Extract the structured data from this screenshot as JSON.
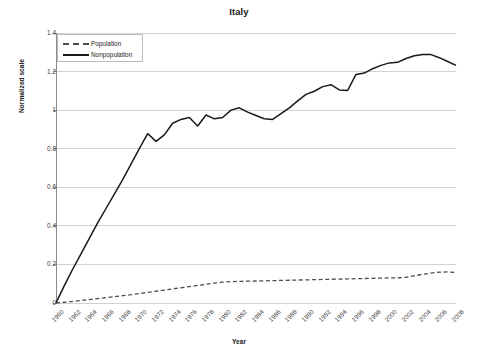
{
  "chart_data": {
    "type": "line",
    "title": "Italy",
    "xlabel": "Year",
    "ylabel": "Normalized scale",
    "xlim": [
      1960,
      2008
    ],
    "ylim": [
      0,
      1.4
    ],
    "yticks": [
      "0",
      "0.2",
      "0.4",
      "0.6",
      "0.8",
      "1",
      "1.2",
      "1.4"
    ],
    "ytick_values": [
      0,
      0.2,
      0.4,
      0.6,
      0.8,
      1.0,
      1.2,
      1.4
    ],
    "xticks": [
      "1960",
      "1962",
      "1964",
      "1966",
      "1968",
      "1970",
      "1972",
      "1974",
      "1976",
      "1978",
      "1980",
      "1982",
      "1984",
      "1986",
      "1988",
      "1990",
      "1992",
      "1994",
      "1996",
      "1998",
      "2000",
      "2002",
      "2004",
      "2006",
      "2008"
    ],
    "grid": "horizontal",
    "legend_position": "top-left",
    "x": [
      1960,
      1961,
      1962,
      1963,
      1964,
      1965,
      1966,
      1967,
      1968,
      1969,
      1970,
      1971,
      1972,
      1973,
      1974,
      1975,
      1976,
      1977,
      1978,
      1979,
      1980,
      1981,
      1982,
      1983,
      1984,
      1985,
      1986,
      1987,
      1988,
      1989,
      1990,
      1991,
      1992,
      1993,
      1994,
      1995,
      1996,
      1997,
      1998,
      1999,
      2000,
      2001,
      2002,
      2003,
      2004,
      2005,
      2006,
      2007,
      2008
    ],
    "series": [
      {
        "name": "Population",
        "style": "dashed",
        "color": "#4d4d4d",
        "values": [
          0.0,
          0.004,
          0.008,
          0.013,
          0.018,
          0.023,
          0.028,
          0.033,
          0.038,
          0.043,
          0.049,
          0.055,
          0.061,
          0.067,
          0.073,
          0.079,
          0.085,
          0.091,
          0.097,
          0.103,
          0.108,
          0.111,
          0.112,
          0.113,
          0.114,
          0.115,
          0.116,
          0.117,
          0.118,
          0.119,
          0.12,
          0.121,
          0.122,
          0.123,
          0.124,
          0.125,
          0.126,
          0.127,
          0.128,
          0.129,
          0.13,
          0.131,
          0.133,
          0.141,
          0.149,
          0.155,
          0.16,
          0.161,
          0.158
        ]
      },
      {
        "name": "Nonpopulation",
        "style": "solid",
        "color": "#1a1a1a",
        "values": [
          0.0,
          0.09,
          0.175,
          0.255,
          0.335,
          0.415,
          0.49,
          0.565,
          0.64,
          0.72,
          0.8,
          0.878,
          0.838,
          0.872,
          0.932,
          0.952,
          0.962,
          0.918,
          0.975,
          0.955,
          0.962,
          1.0,
          1.012,
          0.99,
          0.972,
          0.955,
          0.952,
          0.982,
          1.012,
          1.048,
          1.082,
          1.098,
          1.122,
          1.132,
          1.105,
          1.102,
          1.185,
          1.192,
          1.215,
          1.232,
          1.245,
          1.248,
          1.268,
          1.282,
          1.288,
          1.288,
          1.272,
          1.252,
          1.232
        ]
      }
    ]
  },
  "legend": {
    "items": [
      {
        "label": "Population"
      },
      {
        "label": "Nonpopulation"
      }
    ]
  }
}
